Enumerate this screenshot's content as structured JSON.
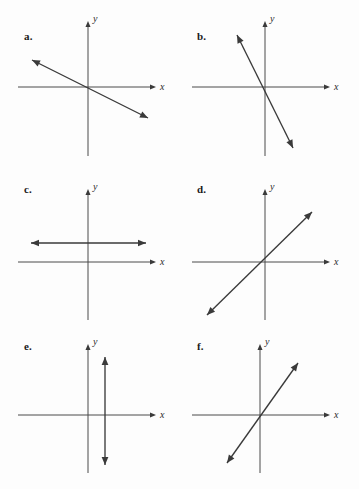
{
  "figure": {
    "background_color": "#fdfdfd",
    "axis_color": "#4a4a4a",
    "line_color": "#3a3a3a",
    "label_color": "#1a1a1a"
  },
  "axis_labels": {
    "x": "x",
    "y": "y"
  },
  "panels": [
    {
      "id": "a",
      "label": "a.",
      "label_x": 24,
      "label_y": 22,
      "description": "line with shallow negative slope through the origin",
      "origin_x": 88,
      "origin_y": 79,
      "x_axis": {
        "x1": 18,
        "x2": 152,
        "y": 79,
        "arrow": "right"
      },
      "y_axis": {
        "y1": 16,
        "y2": 148,
        "x": 88,
        "arrow": "up"
      },
      "x_label_pos": {
        "x": 160,
        "y": 82
      },
      "y_label_pos": {
        "x": 93,
        "y": 14
      },
      "graph_line": {
        "type": "double-arrow",
        "x1": 32,
        "y1": 52,
        "x2": 148,
        "y2": 110,
        "slope": -0.5
      }
    },
    {
      "id": "b",
      "label": "b.",
      "label_x": 17,
      "label_y": 22,
      "description": "line with steep negative slope crossing y-axis above origin",
      "origin_x": 85,
      "origin_y": 79,
      "x_axis": {
        "x1": 12,
        "x2": 146,
        "y": 79,
        "arrow": "right"
      },
      "y_axis": {
        "y1": 16,
        "y2": 148,
        "x": 85,
        "arrow": "up"
      },
      "x_label_pos": {
        "x": 154,
        "y": 82
      },
      "y_label_pos": {
        "x": 90,
        "y": 14
      },
      "graph_line": {
        "type": "double-arrow",
        "x1": 57,
        "y1": 27,
        "x2": 113,
        "y2": 140,
        "slope": -2.0
      }
    },
    {
      "id": "c",
      "label": "c.",
      "label_x": 24,
      "label_y": 13,
      "description": "horizontal line above the x-axis",
      "origin_x": 88,
      "origin_y": 92,
      "x_axis": {
        "x1": 18,
        "x2": 152,
        "y": 92,
        "arrow": "right"
      },
      "y_axis": {
        "y1": 22,
        "y2": 150,
        "x": 88,
        "arrow": "up"
      },
      "x_label_pos": {
        "x": 160,
        "y": 95
      },
      "y_label_pos": {
        "x": 93,
        "y": 20
      },
      "graph_line": {
        "type": "double-arrow",
        "x1": 31,
        "y1": 73,
        "x2": 146,
        "y2": 73,
        "slope": 0
      }
    },
    {
      "id": "d",
      "label": "d.",
      "label_x": 17,
      "label_y": 13,
      "description": "line with positive slope near 1 through the origin",
      "origin_x": 85,
      "origin_y": 92,
      "x_axis": {
        "x1": 12,
        "x2": 146,
        "y": 92,
        "arrow": "right"
      },
      "y_axis": {
        "y1": 22,
        "y2": 150,
        "x": 85,
        "arrow": "up"
      },
      "x_label_pos": {
        "x": 154,
        "y": 95
      },
      "y_label_pos": {
        "x": 90,
        "y": 20
      },
      "graph_line": {
        "type": "double-arrow",
        "x1": 27,
        "y1": 145,
        "x2": 132,
        "y2": 42,
        "slope": 1.0
      }
    },
    {
      "id": "e",
      "label": "e.",
      "label_x": 24,
      "label_y": 15,
      "description": "vertical line to the right of the y-axis",
      "origin_x": 88,
      "origin_y": 90,
      "x_axis": {
        "x1": 18,
        "x2": 152,
        "y": 90,
        "arrow": "right"
      },
      "y_axis": {
        "y1": 22,
        "y2": 148,
        "x": 88,
        "arrow": "up"
      },
      "x_label_pos": {
        "x": 160,
        "y": 93
      },
      "y_label_pos": {
        "x": 93,
        "y": 20
      },
      "graph_line": {
        "type": "double-arrow",
        "x1": 105,
        "y1": 32,
        "x2": 105,
        "y2": 140,
        "slope": "undefined"
      }
    },
    {
      "id": "f",
      "label": "f.",
      "label_x": 17,
      "label_y": 15,
      "description": "line with steep positive slope through the origin",
      "origin_x": 80,
      "origin_y": 90,
      "x_axis": {
        "x1": 12,
        "x2": 146,
        "y": 90,
        "arrow": "right"
      },
      "y_axis": {
        "y1": 22,
        "y2": 148,
        "x": 80,
        "arrow": "up"
      },
      "x_label_pos": {
        "x": 154,
        "y": 93
      },
      "y_label_pos": {
        "x": 85,
        "y": 20
      },
      "graph_line": {
        "type": "double-arrow",
        "x1": 47,
        "y1": 138,
        "x2": 118,
        "y2": 38,
        "slope": 1.5
      }
    }
  ],
  "panel_positions": [
    {
      "id": "a",
      "left": 0,
      "top": 8
    },
    {
      "id": "b",
      "left": 180,
      "top": 8
    },
    {
      "id": "c",
      "left": 0,
      "top": 170
    },
    {
      "id": "d",
      "left": 180,
      "top": 170
    },
    {
      "id": "e",
      "left": 0,
      "top": 325
    },
    {
      "id": "f",
      "left": 180,
      "top": 325
    }
  ]
}
